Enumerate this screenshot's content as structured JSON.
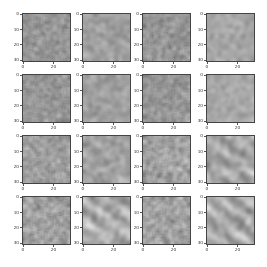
{
  "figure": {
    "rows": 4,
    "cols": 4,
    "col_left": [
      22,
      82,
      142,
      206
    ],
    "row_top": [
      13,
      74,
      135,
      196
    ],
    "panel_size": 49,
    "image_pixels": 32,
    "yticks": [
      {
        "label": "0",
        "value": 0
      },
      {
        "label": "10",
        "value": 10
      },
      {
        "label": "20",
        "value": 20
      },
      {
        "label": "30",
        "value": 30
      }
    ],
    "xticks": [
      {
        "label": "0",
        "value": 0
      },
      {
        "label": "20",
        "value": 20
      }
    ],
    "colormap": "gray"
  },
  "panels": [
    {
      "id": "r0c0",
      "seed": 11,
      "mean": 150,
      "contrast": 18,
      "smooth": 1,
      "streaks": 0
    },
    {
      "id": "r0c1",
      "seed": 23,
      "mean": 160,
      "contrast": 22,
      "smooth": 2,
      "streaks": 0.3
    },
    {
      "id": "r0c2",
      "seed": 37,
      "mean": 150,
      "contrast": 18,
      "smooth": 1,
      "streaks": 0
    },
    {
      "id": "r0c3",
      "seed": 41,
      "mean": 165,
      "contrast": 18,
      "smooth": 2,
      "streaks": 0.1
    },
    {
      "id": "r1c0",
      "seed": 53,
      "mean": 150,
      "contrast": 18,
      "smooth": 1,
      "streaks": 0
    },
    {
      "id": "r1c1",
      "seed": 67,
      "mean": 160,
      "contrast": 18,
      "smooth": 2,
      "streaks": 0.1
    },
    {
      "id": "r1c2",
      "seed": 71,
      "mean": 150,
      "contrast": 18,
      "smooth": 1,
      "streaks": 0
    },
    {
      "id": "r1c3",
      "seed": 83,
      "mean": 168,
      "contrast": 18,
      "smooth": 2,
      "streaks": 0.1
    },
    {
      "id": "r2c0",
      "seed": 97,
      "mean": 158,
      "contrast": 20,
      "smooth": 1,
      "streaks": 0
    },
    {
      "id": "r2c1",
      "seed": 101,
      "mean": 162,
      "contrast": 24,
      "smooth": 2,
      "streaks": 0.4
    },
    {
      "id": "r2c2",
      "seed": 113,
      "mean": 158,
      "contrast": 22,
      "smooth": 1,
      "streaks": 0.2
    },
    {
      "id": "r2c3",
      "seed": 127,
      "mean": 165,
      "contrast": 34,
      "smooth": 3,
      "streaks": 0.8
    },
    {
      "id": "r3c0",
      "seed": 131,
      "mean": 158,
      "contrast": 22,
      "smooth": 1,
      "streaks": 0.2
    },
    {
      "id": "r3c1",
      "seed": 149,
      "mean": 168,
      "contrast": 36,
      "smooth": 3,
      "streaks": 0.9
    },
    {
      "id": "r3c2",
      "seed": 151,
      "mean": 160,
      "contrast": 22,
      "smooth": 1,
      "streaks": 0.3
    },
    {
      "id": "r3c3",
      "seed": 163,
      "mean": 172,
      "contrast": 36,
      "smooth": 3,
      "streaks": 0.9
    }
  ]
}
